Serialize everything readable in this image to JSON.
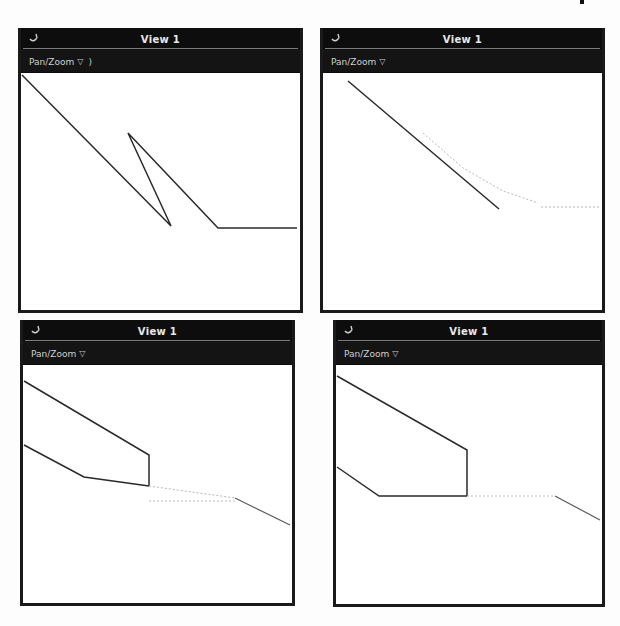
{
  "windows": [
    {
      "id": "top-left",
      "title": "View 1",
      "title_icon": "app-menu-icon",
      "toolbar": {
        "mode_label": "Pan/Zoom",
        "mode_arrow": "▽",
        "suffix": ")"
      }
    },
    {
      "id": "top-right",
      "title": "View 1",
      "title_icon": "app-menu-icon",
      "toolbar": {
        "mode_label": "Pan/Zoom",
        "mode_arrow": "▽",
        "suffix": ""
      }
    },
    {
      "id": "bottom-left",
      "title": "View 1",
      "title_icon": "app-menu-icon",
      "toolbar": {
        "mode_label": "Pan/Zoom",
        "mode_arrow": "▽",
        "suffix": ""
      }
    },
    {
      "id": "bottom-right",
      "title": "View 1",
      "title_icon": "app-menu-icon",
      "toolbar": {
        "mode_label": "Pan/Zoom",
        "mode_arrow": "▽",
        "suffix": ""
      }
    }
  ],
  "colors": {
    "titlebar_bg": "#0d0d0d",
    "toolbar_bg": "#141414",
    "canvas_bg": "#ffffff",
    "line": "#2a2a2a",
    "faint_line": "#b8b8b8"
  }
}
